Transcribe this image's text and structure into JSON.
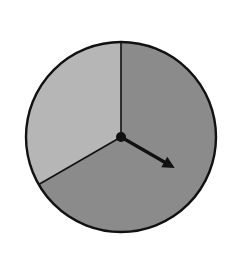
{
  "spinner": {
    "center": [
      121,
      137
    ],
    "radius": 95,
    "sectors": [
      {
        "name": "dark",
        "fraction": 0.6667,
        "start_deg": 0,
        "end_deg": 240,
        "color": "#8b8b8b"
      },
      {
        "name": "light",
        "fraction": 0.3333,
        "start_deg": 240,
        "end_deg": 360,
        "color": "#b6b6b6"
      }
    ],
    "arrow": {
      "angle_deg": 120,
      "length": 62,
      "color": "#111111"
    },
    "outline_color": "#111111"
  }
}
